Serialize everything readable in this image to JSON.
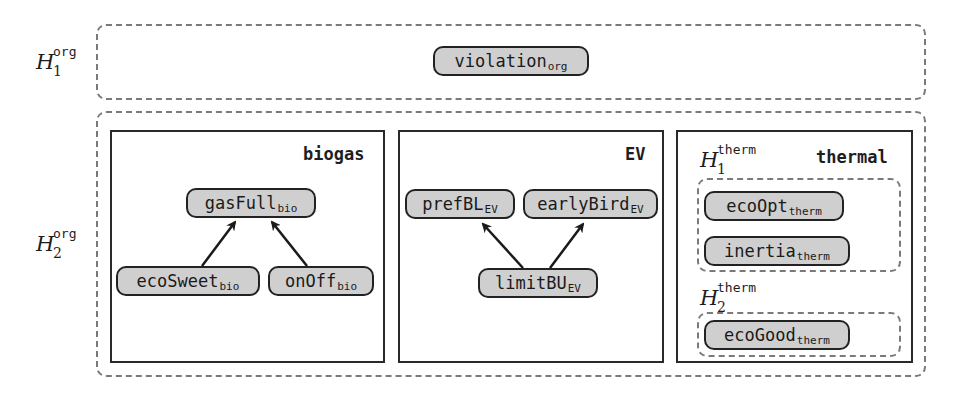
{
  "layers": {
    "h1": {
      "symbol": "H",
      "sub": "1",
      "sup": "org"
    },
    "h2": {
      "symbol": "H",
      "sub": "2",
      "sup": "org"
    }
  },
  "h1_nodes": [
    {
      "id": "violation",
      "name": "violation",
      "sub": "org"
    }
  ],
  "groups": {
    "biogas": {
      "title": "biogas",
      "nodes": [
        {
          "id": "gasFull",
          "name": "gasFull",
          "sub": "bio"
        },
        {
          "id": "ecoSweet",
          "name": "ecoSweet",
          "sub": "bio"
        },
        {
          "id": "onOff",
          "name": "onOff",
          "sub": "bio"
        }
      ],
      "edges": [
        {
          "from": "ecoSweet",
          "to": "gasFull"
        },
        {
          "from": "onOff",
          "to": "gasFull"
        }
      ]
    },
    "ev": {
      "title": "EV",
      "nodes": [
        {
          "id": "prefBL",
          "name": "prefBL",
          "sub": "EV"
        },
        {
          "id": "earlyBird",
          "name": "earlyBird",
          "sub": "EV"
        },
        {
          "id": "limitBU",
          "name": "limitBU",
          "sub": "EV"
        }
      ],
      "edges": [
        {
          "from": "limitBU",
          "to": "prefBL"
        },
        {
          "from": "limitBU",
          "to": "earlyBird"
        }
      ]
    },
    "thermal": {
      "title": "thermal",
      "h1": {
        "symbol": "H",
        "sub": "1",
        "sup": "therm"
      },
      "h2": {
        "symbol": "H",
        "sub": "2",
        "sup": "therm"
      },
      "h1_nodes": [
        {
          "id": "ecoOpt",
          "name": "ecoOpt",
          "sub": "therm"
        },
        {
          "id": "inertia",
          "name": "inertia",
          "sub": "therm"
        }
      ],
      "h2_nodes": [
        {
          "id": "ecoGood",
          "name": "ecoGood",
          "sub": "therm"
        }
      ]
    }
  },
  "colors": {
    "node_fill": "#cfcfcf",
    "node_border": "#222222",
    "dashed_border": "#7a7a7a",
    "solid_border": "#2a2a2a"
  }
}
